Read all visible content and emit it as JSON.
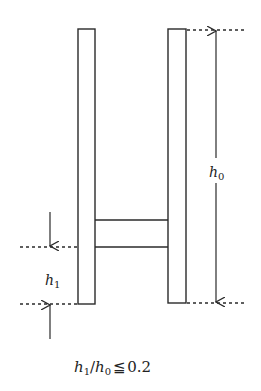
{
  "diagram": {
    "type": "structural-frame-dimension-sketch",
    "colors": {
      "stroke": "#2a2a2a",
      "background": "#ffffff"
    },
    "left_pillar": {
      "x": 78,
      "y": 29,
      "w": 17,
      "h": 275
    },
    "right_pillar": {
      "x": 168,
      "y": 29,
      "w": 18,
      "h": 274
    },
    "crossbar": {
      "x1": 95,
      "x2": 168,
      "y_top": 220,
      "y_bottom": 247
    },
    "dimension_h0": {
      "label_main": "h",
      "label_sub": "0",
      "arrow_x": 216,
      "y_top": 30,
      "y_bottom": 303,
      "label_y": 172
    },
    "dimension_h1": {
      "label_main": "h",
      "label_sub": "1",
      "arrow_x": 50,
      "y_top": 247,
      "y_bottom": 304,
      "label_y": 283
    },
    "formula": {
      "h1": "h",
      "sub1": "1",
      "slash": "/",
      "h0": "h",
      "sub0": "0",
      "relation": "≦",
      "value": "0.2"
    }
  }
}
